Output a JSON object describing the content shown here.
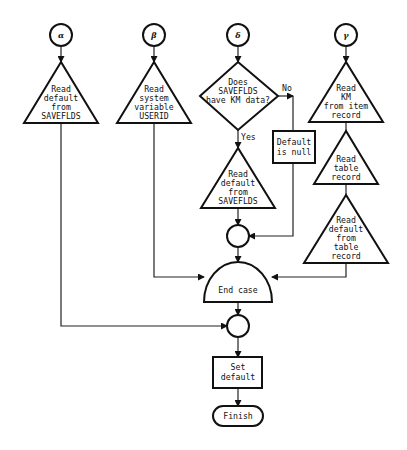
{
  "diagram": {
    "type": "flowchart",
    "entry_points": [
      {
        "id": "alpha",
        "label": "α"
      },
      {
        "id": "beta",
        "label": "β"
      },
      {
        "id": "delta",
        "label": "δ"
      },
      {
        "id": "gamma",
        "label": "γ"
      }
    ],
    "alpha_branch": {
      "read_default": [
        "Read",
        "default",
        "from",
        "SAVEFLDS"
      ]
    },
    "beta_branch": {
      "read_userid": [
        "Read",
        "system",
        "variable",
        "USERID"
      ]
    },
    "delta_branch": {
      "decision": [
        "Does",
        "SAVEFLDS",
        "have KM data?"
      ],
      "no_label": "No",
      "yes_label": "Yes",
      "null_box": [
        "Default",
        "is null"
      ],
      "read_default": [
        "Read",
        "default",
        "from",
        "SAVEFLDS"
      ]
    },
    "gamma_branch": {
      "read_km": [
        "Read",
        "KM",
        "from item",
        "record"
      ],
      "read_table": [
        "Read",
        "table",
        "record"
      ],
      "read_default_table": [
        "Read",
        "default",
        "from",
        "table",
        "record"
      ]
    },
    "end_case": "End case",
    "set_default": [
      "Set",
      "default"
    ],
    "finish": "Finish"
  }
}
